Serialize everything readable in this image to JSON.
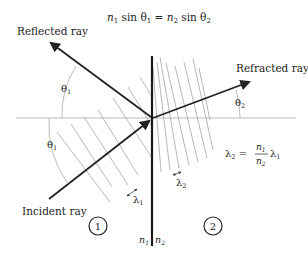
{
  "diagram": {
    "equation_top": {
      "n1": "n",
      "n1_sub": "1",
      "sin1": " sin θ",
      "theta1_sub": "1",
      "eq": " = ",
      "n2": "n",
      "n2_sub": "2",
      "sin2": " sin θ",
      "theta2_sub": "2"
    },
    "labels": {
      "reflected_ray": "Reflected ray",
      "refracted_ray": "Refracted ray",
      "incident_ray": "Incident ray",
      "theta1_reflected": "θ",
      "theta1_reflected_sub": "1",
      "theta1_incident": "θ",
      "theta1_incident_sub": "1",
      "theta2": "θ",
      "theta2_sub": "2",
      "lambda1": "λ",
      "lambda1_sub": "1",
      "lambda2": "λ",
      "lambda2_sub": "2",
      "medium1": "1",
      "medium2": "2",
      "n1": "n",
      "n1_sub": "1",
      "n2": "n",
      "n2_sub": "2"
    },
    "wavelength_equation": {
      "lhs": "λ",
      "lhs_sub": "2",
      "eq": " = ",
      "num": "n",
      "num_sub": "1",
      "den": "n",
      "den_sub": "2",
      "rhs": "λ",
      "rhs_sub": "1"
    },
    "colors": {
      "ray": "#222222",
      "interface": "#1a1a1a",
      "wavefront": "#9a9a9a",
      "normal": "#b0b0b0"
    }
  }
}
